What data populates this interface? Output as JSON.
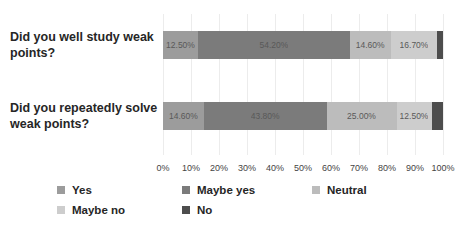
{
  "chart_data": {
    "type": "bar",
    "stacked": true,
    "orientation": "horizontal",
    "title": "",
    "categories": [
      "Did you well study weak points?",
      "Did you repeatedly solve weak points?"
    ],
    "series": [
      {
        "name": "Yes",
        "color": "#9c9c9c",
        "values": [
          12.5,
          14.6
        ],
        "labels": [
          "12.50%",
          "14.60%"
        ]
      },
      {
        "name": "Maybe yes",
        "color": "#7b7b7b",
        "values": [
          54.2,
          43.8
        ],
        "labels": [
          "54.20%",
          "43.80%"
        ]
      },
      {
        "name": "Neutral",
        "color": "#bcbcbc",
        "values": [
          14.6,
          25.0
        ],
        "labels": [
          "14.60%",
          "25.00%"
        ]
      },
      {
        "name": "Maybe no",
        "color": "#cdcdcd",
        "values": [
          16.7,
          12.5
        ],
        "labels": [
          "16.70%",
          "12.50%"
        ]
      },
      {
        "name": "No",
        "color": "#4d4d4d",
        "values": [
          2.1,
          4.2
        ],
        "labels": [
          "",
          ""
        ]
      }
    ],
    "x_ticks": [
      "0%",
      "10%",
      "20%",
      "30%",
      "40%",
      "50%",
      "60%",
      "70%",
      "80%",
      "90%",
      "100%"
    ],
    "xlim": [
      0,
      100
    ],
    "grid": true,
    "legend_position": "bottom",
    "legend_rows": [
      [
        "Yes",
        "Maybe yes",
        "Neutral"
      ],
      [
        "Maybe no",
        "No"
      ]
    ],
    "colors": {
      "gridline": "#ececec",
      "axis_text": "#444444",
      "category_text": "#262626",
      "data_label_text": "#595959"
    }
  }
}
